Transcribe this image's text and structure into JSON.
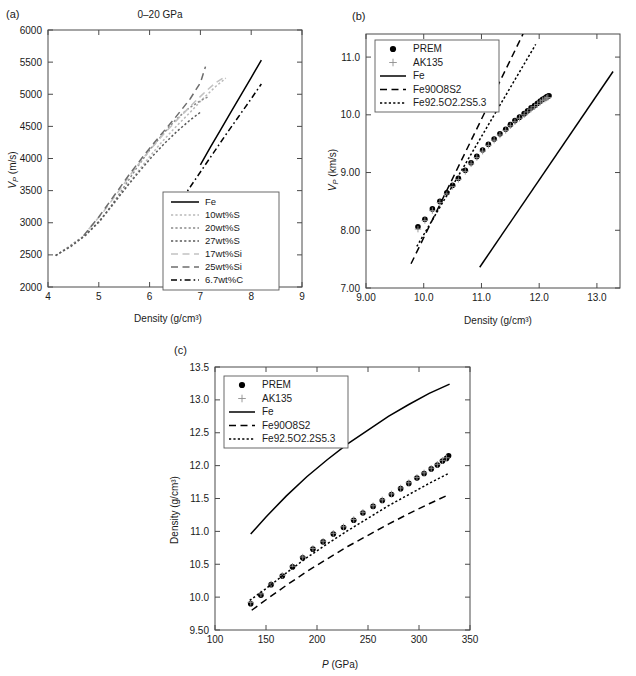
{
  "figure": {
    "panels": [
      "(a)",
      "(b)",
      "(c)"
    ]
  },
  "panel_a": {
    "tag": "(a)",
    "title": "0–20 GPa",
    "xlabel": "Density (g/cm³)",
    "ylabel": "V_P (m/s)",
    "ylabel_italic": "V",
    "ylabel_sub": "P",
    "ylabel_rest": " (m/s)",
    "xticks": [
      "4",
      "5",
      "6",
      "7",
      "8",
      "9"
    ],
    "yticks": [
      "2000",
      "2500",
      "3000",
      "3500",
      "4000",
      "4500",
      "5000",
      "5500",
      "6000"
    ],
    "legend": [
      {
        "label": "Fe",
        "style": "solid",
        "color": "#000000"
      },
      {
        "label": "10wt%S",
        "style": "dotted",
        "color": "#b9b9b9"
      },
      {
        "label": "20wt%S",
        "style": "dotted",
        "color": "#8a8a8a"
      },
      {
        "label": "27wt%S",
        "style": "dotted",
        "color": "#595959"
      },
      {
        "label": "17wt%Si",
        "style": "dashed",
        "color": "#c2c2c2"
      },
      {
        "label": "25wt%Si",
        "style": "dashed",
        "color": "#6d6d6d"
      },
      {
        "label": "6.7wt%C",
        "style": "dashdot",
        "color": "#000000"
      }
    ]
  },
  "panel_b": {
    "tag": "(b)",
    "xlabel": "Density (g/cm³)",
    "ylabel": "V_P (km/s)",
    "ylabel_italic": "V",
    "ylabel_sub": "P",
    "ylabel_rest": " (km/s)",
    "xticks": [
      "9.00",
      "10.0",
      "11.0",
      "12.0",
      "13.0"
    ],
    "yticks": [
      "7.00",
      "8.00",
      "9.00",
      "10.0",
      "11.0"
    ],
    "legend": [
      {
        "label": "PREM",
        "style": "marker-dot",
        "color": "#000000"
      },
      {
        "label": "AK135",
        "style": "marker-plus",
        "color": "#8f8f8f"
      },
      {
        "label": "Fe",
        "style": "solid",
        "color": "#000000"
      },
      {
        "label": "Fe90O8S2",
        "style": "dashed",
        "color": "#000000"
      },
      {
        "label": "Fe92.5O2.2S5.3",
        "style": "dotted",
        "color": "#000000"
      }
    ]
  },
  "panel_c": {
    "tag": "(c)",
    "xlabel": "P (GPa)",
    "xlabel_italic": "P",
    "xlabel_rest": " (GPa)",
    "ylabel": "Density (g/cm³)",
    "xticks": [
      "100",
      "150",
      "200",
      "250",
      "300",
      "350"
    ],
    "yticks": [
      "9.50",
      "10.0",
      "10.5",
      "11.0",
      "11.5",
      "12.0",
      "12.5",
      "13.0",
      "13.5"
    ],
    "legend": [
      {
        "label": "PREM",
        "style": "marker-dot",
        "color": "#000000"
      },
      {
        "label": "AK135",
        "style": "marker-plus",
        "color": "#8f8f8f"
      },
      {
        "label": "Fe",
        "style": "solid",
        "color": "#000000"
      },
      {
        "label": "Fe90O8S2",
        "style": "dashed",
        "color": "#000000"
      },
      {
        "label": "Fe92.5O2.2S5.3",
        "style": "dotted",
        "color": "#000000"
      }
    ]
  },
  "chart_data": [
    {
      "type": "line",
      "panel": "(a)",
      "title": "0–20 GPa",
      "xlabel": "Density (g/cm3)",
      "ylabel": "VP (m/s)",
      "xlim": [
        4,
        9
      ],
      "ylim": [
        2000,
        6000
      ],
      "xticks": [
        4,
        5,
        6,
        7,
        8,
        9
      ],
      "yticks": [
        2000,
        2500,
        3000,
        3500,
        4000,
        4500,
        5000,
        5500,
        6000
      ],
      "grid": false,
      "legend_position": "lower-right",
      "series": [
        {
          "name": "Fe",
          "style": "solid",
          "color": "#000000",
          "x": [
            7.0,
            7.2,
            7.4,
            7.6,
            7.8,
            8.0,
            8.2
          ],
          "y": [
            3900,
            4180,
            4450,
            4720,
            4990,
            5260,
            5530
          ]
        },
        {
          "name": "10wt%S",
          "style": "dotted",
          "color": "#b9b9b9",
          "x": [
            4.15,
            4.4,
            4.7,
            5.0,
            5.3,
            5.6,
            5.9,
            6.2,
            6.5,
            6.8,
            7.05,
            7.3,
            7.5
          ],
          "y": [
            2490,
            2620,
            2790,
            3000,
            3300,
            3620,
            3930,
            4220,
            4480,
            4720,
            4930,
            5120,
            5250
          ]
        },
        {
          "name": "20wt%S",
          "style": "dotted",
          "color": "#8a8a8a",
          "x": [
            4.15,
            4.4,
            4.7,
            5.0,
            5.25,
            5.5,
            5.75,
            6.0,
            6.25,
            6.5,
            6.75,
            7.0,
            7.15
          ],
          "y": [
            2490,
            2620,
            2790,
            3010,
            3270,
            3560,
            3860,
            4130,
            4370,
            4590,
            4770,
            4900,
            4960
          ]
        },
        {
          "name": "27wt%S",
          "style": "dotted",
          "color": "#595959",
          "x": [
            4.15,
            4.45,
            4.75,
            5.05,
            5.3,
            5.55,
            5.8,
            6.05,
            6.3,
            6.55,
            6.8,
            7.0
          ],
          "y": [
            2490,
            2630,
            2810,
            3060,
            3310,
            3560,
            3800,
            4030,
            4240,
            4430,
            4600,
            4720
          ]
        },
        {
          "name": "17wt%Si",
          "style": "dashed",
          "color": "#c2c2c2",
          "x": [
            4.8,
            5.1,
            5.4,
            5.7,
            6.0,
            6.3,
            6.6,
            6.9,
            7.1,
            7.3,
            7.5
          ],
          "y": [
            2900,
            3180,
            3500,
            3830,
            4130,
            4400,
            4650,
            4890,
            5040,
            5180,
            5280
          ]
        },
        {
          "name": "25wt%Si",
          "style": "dashed",
          "color": "#6d6d6d",
          "x": [
            4.7,
            5.0,
            5.3,
            5.6,
            5.9,
            6.2,
            6.5,
            6.8,
            7.0,
            7.1
          ],
          "y": [
            2800,
            3090,
            3420,
            3750,
            4060,
            4350,
            4630,
            4930,
            5180,
            5430
          ]
        },
        {
          "name": "6.7wt%C",
          "style": "dashdot",
          "color": "#000000",
          "x": [
            6.5,
            6.75,
            7.0,
            7.25,
            7.5,
            7.75,
            8.0,
            8.2
          ],
          "y": [
            3200,
            3500,
            3790,
            4080,
            4370,
            4650,
            4930,
            5160
          ]
        }
      ]
    },
    {
      "type": "scatter-line",
      "panel": "(b)",
      "xlabel": "Density (g/cm3)",
      "ylabel": "VP (km/s)",
      "xlim": [
        9.0,
        13.4
      ],
      "ylim": [
        7.0,
        11.4
      ],
      "xticks": [
        9.0,
        10.0,
        11.0,
        12.0,
        13.0
      ],
      "yticks": [
        7.0,
        8.0,
        9.0,
        10.0,
        11.0
      ],
      "grid": false,
      "legend_position": "upper-left",
      "series": [
        {
          "name": "PREM",
          "style": "marker-dot",
          "color": "#000000",
          "x": [
            9.9,
            10.02,
            10.15,
            10.28,
            10.4,
            10.5,
            10.6,
            10.72,
            10.82,
            10.92,
            11.02,
            11.12,
            11.22,
            11.32,
            11.42,
            11.5,
            11.58,
            11.66,
            11.74,
            11.8,
            11.86,
            11.92,
            11.97,
            12.02,
            12.06,
            12.1,
            12.13,
            12.15,
            12.17
          ],
          "y": [
            8.06,
            8.19,
            8.37,
            8.5,
            8.65,
            8.78,
            8.9,
            9.04,
            9.17,
            9.28,
            9.39,
            9.49,
            9.58,
            9.67,
            9.75,
            9.83,
            9.9,
            9.96,
            10.02,
            10.07,
            10.12,
            10.16,
            10.2,
            10.24,
            10.27,
            10.29,
            10.31,
            10.32,
            10.33
          ]
        },
        {
          "name": "AK135",
          "style": "marker-plus",
          "color": "#8f8f8f",
          "x": [
            9.9,
            10.02,
            10.15,
            10.28,
            10.4,
            10.5,
            10.6,
            10.72,
            10.82,
            10.92,
            11.02,
            11.12,
            11.22,
            11.32,
            11.42,
            11.5,
            11.58,
            11.66,
            11.74,
            11.8,
            11.86,
            11.92,
            11.97,
            12.02,
            12.06,
            12.1,
            12.13,
            12.15
          ],
          "y": [
            8.02,
            8.17,
            8.34,
            8.48,
            8.63,
            8.76,
            8.88,
            9.02,
            9.15,
            9.26,
            9.37,
            9.47,
            9.56,
            9.65,
            9.73,
            9.81,
            9.88,
            9.94,
            10.0,
            10.05,
            10.1,
            10.14,
            10.18,
            10.22,
            10.25,
            10.27,
            10.29,
            10.3
          ]
        },
        {
          "name": "Fe",
          "style": "solid",
          "color": "#000000",
          "x": [
            10.97,
            13.28
          ],
          "y": [
            7.36,
            10.75
          ]
        },
        {
          "name": "Fe90O8S2",
          "style": "dashed",
          "color": "#000000",
          "x": [
            9.78,
            11.72
          ],
          "y": [
            7.42,
            11.4
          ]
        },
        {
          "name": "Fe92.5O2.2S5.3",
          "style": "dotted",
          "color": "#000000",
          "x": [
            9.88,
            11.94
          ],
          "y": [
            7.72,
            11.22
          ]
        }
      ]
    },
    {
      "type": "scatter-line",
      "panel": "(c)",
      "xlabel": "P (GPa)",
      "ylabel": "Density (g/cm3)",
      "xlim": [
        100,
        350
      ],
      "ylim": [
        9.5,
        13.5
      ],
      "xticks": [
        100,
        150,
        200,
        250,
        300,
        350
      ],
      "yticks": [
        9.5,
        10.0,
        10.5,
        11.0,
        11.5,
        12.0,
        12.5,
        13.0,
        13.5
      ],
      "grid": false,
      "legend_position": "upper-left",
      "series": [
        {
          "name": "PREM",
          "style": "marker-dot",
          "color": "#000000",
          "x": [
            135,
            145,
            155,
            166,
            176,
            186,
            196,
            206,
            216,
            226,
            236,
            245,
            255,
            264,
            273,
            282,
            290,
            298,
            305,
            312,
            318,
            323,
            327,
            329
          ],
          "y": [
            9.9,
            10.03,
            10.19,
            10.32,
            10.46,
            10.6,
            10.73,
            10.84,
            10.96,
            11.06,
            11.17,
            11.28,
            11.38,
            11.47,
            11.56,
            11.65,
            11.73,
            11.81,
            11.88,
            11.95,
            12.01,
            12.07,
            12.11,
            12.15
          ]
        },
        {
          "name": "AK135",
          "style": "marker-plus",
          "color": "#8f8f8f",
          "x": [
            135,
            145,
            155,
            166,
            176,
            186,
            196,
            206,
            216,
            226,
            236,
            245,
            255,
            264,
            273,
            282,
            290,
            298,
            305,
            312,
            318,
            323,
            327
          ],
          "y": [
            9.92,
            10.05,
            10.2,
            10.33,
            10.47,
            10.61,
            10.74,
            10.85,
            10.97,
            11.07,
            11.18,
            11.29,
            11.39,
            11.48,
            11.57,
            11.66,
            11.74,
            11.82,
            11.89,
            11.96,
            12.02,
            12.08,
            12.12
          ]
        },
        {
          "name": "Fe",
          "style": "solid",
          "color": "#000000",
          "x": [
            135,
            150,
            170,
            190,
            210,
            230,
            250,
            270,
            290,
            310,
            330
          ],
          "y": [
            10.96,
            11.22,
            11.54,
            11.83,
            12.09,
            12.33,
            12.54,
            12.75,
            12.93,
            13.1,
            13.24
          ]
        },
        {
          "name": "Fe90O8S2",
          "style": "dashed",
          "color": "#000000",
          "x": [
            136,
            150,
            170,
            190,
            210,
            230,
            250,
            270,
            290,
            310,
            328
          ],
          "y": [
            9.8,
            9.96,
            10.18,
            10.39,
            10.58,
            10.77,
            10.94,
            11.11,
            11.27,
            11.42,
            11.55
          ]
        },
        {
          "name": "Fe92.5O2.2S5.3",
          "style": "dotted",
          "color": "#000000",
          "x": [
            134,
            150,
            170,
            190,
            210,
            230,
            250,
            270,
            290,
            310,
            329
          ],
          "y": [
            9.95,
            10.13,
            10.37,
            10.6,
            10.81,
            11.01,
            11.2,
            11.39,
            11.56,
            11.73,
            11.88
          ]
        }
      ]
    }
  ]
}
